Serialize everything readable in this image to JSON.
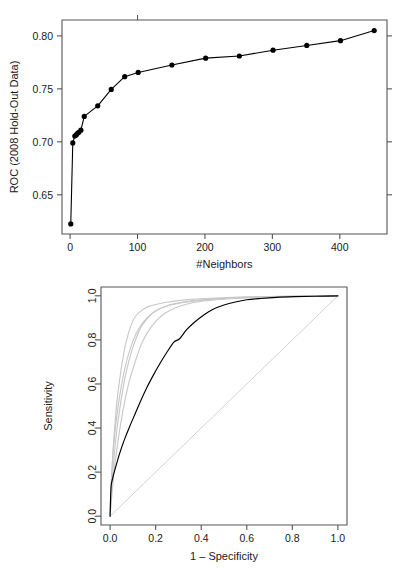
{
  "figure": {
    "title": "",
    "panel_count": 2
  },
  "chart_data": [
    {
      "id": "neighbors-roc",
      "type": "line",
      "title": "",
      "xlabel": "#Neighbors",
      "ylabel": "ROC (2008 Hold-Out Data)",
      "xlim": [
        -12,
        470
      ],
      "ylim": [
        0.613,
        0.815
      ],
      "xticks": [
        0,
        100,
        200,
        300,
        400
      ],
      "xtick_labels": [
        "0",
        "100",
        "200",
        "300",
        "400"
      ],
      "yticks": [
        0.65,
        0.7,
        0.75,
        0.8
      ],
      "ytick_labels": [
        "0.65",
        "0.70",
        "0.75",
        "0.80"
      ],
      "grid": false,
      "legend": "none",
      "marker": "filled-circle",
      "series": [
        {
          "name": "ROC vs neighbors",
          "color": "#000000",
          "x": [
            1,
            4,
            7,
            9,
            11,
            13,
            16,
            21,
            41,
            61,
            81,
            101,
            151,
            201,
            251,
            301,
            351,
            401,
            451
          ],
          "y": [
            0.6225,
            0.699,
            0.7055,
            0.7065,
            0.708,
            0.709,
            0.711,
            0.724,
            0.734,
            0.7495,
            0.7615,
            0.7655,
            0.7725,
            0.779,
            0.781,
            0.7865,
            0.791,
            0.7955,
            0.805
          ]
        }
      ]
    },
    {
      "id": "roc-curves",
      "type": "line",
      "title": "",
      "xlabel": "1 – Specificity",
      "ylabel": "Sensitivity",
      "xlim": [
        -0.04,
        1.04
      ],
      "ylim": [
        -0.04,
        1.04
      ],
      "xticks": [
        0.0,
        0.2,
        0.4,
        0.6,
        0.8,
        1.0
      ],
      "xtick_labels": [
        "0.0",
        "0.2",
        "0.4",
        "0.6",
        "0.8",
        "1.0"
      ],
      "yticks": [
        0.0,
        0.2,
        0.4,
        0.6,
        0.8,
        1.0
      ],
      "ytick_labels": [
        "0.0",
        "0.2",
        "0.4",
        "0.6",
        "0.8",
        "1.0"
      ],
      "grid": false,
      "legend": "none",
      "reference_line": {
        "name": "chance-diagonal",
        "color": "#d2d2d2",
        "from": [
          0.0,
          0.0
        ],
        "to": [
          1.0,
          1.0
        ]
      },
      "series": [
        {
          "name": "gray-curve-1",
          "color": "#c8c8c8",
          "x": [
            0.0,
            0.005,
            0.012,
            0.02,
            0.03,
            0.042,
            0.055,
            0.07,
            0.09,
            0.11,
            0.14,
            0.17,
            0.21,
            0.25,
            0.3,
            0.36,
            0.44,
            0.54,
            0.66,
            0.8,
            1.0
          ],
          "y": [
            0.0,
            0.14,
            0.28,
            0.4,
            0.52,
            0.62,
            0.71,
            0.79,
            0.86,
            0.905,
            0.935,
            0.952,
            0.963,
            0.971,
            0.978,
            0.984,
            0.989,
            0.993,
            0.996,
            0.998,
            1.0
          ]
        },
        {
          "name": "gray-curve-2",
          "color": "#c8c8c8",
          "x": [
            0.0,
            0.006,
            0.015,
            0.026,
            0.04,
            0.055,
            0.072,
            0.092,
            0.115,
            0.14,
            0.17,
            0.205,
            0.245,
            0.29,
            0.345,
            0.41,
            0.49,
            0.58,
            0.7,
            0.84,
            1.0
          ],
          "y": [
            0.0,
            0.12,
            0.24,
            0.36,
            0.47,
            0.57,
            0.66,
            0.74,
            0.81,
            0.865,
            0.905,
            0.934,
            0.953,
            0.966,
            0.975,
            0.983,
            0.989,
            0.993,
            0.996,
            0.998,
            1.0
          ]
        },
        {
          "name": "gray-curve-3",
          "color": "#c8c8c8",
          "x": [
            0.0,
            0.008,
            0.018,
            0.032,
            0.048,
            0.066,
            0.086,
            0.11,
            0.135,
            0.165,
            0.2,
            0.24,
            0.285,
            0.335,
            0.395,
            0.465,
            0.545,
            0.64,
            0.75,
            0.87,
            1.0
          ],
          "y": [
            0.0,
            0.1,
            0.21,
            0.32,
            0.43,
            0.53,
            0.62,
            0.7,
            0.775,
            0.835,
            0.884,
            0.92,
            0.945,
            0.962,
            0.974,
            0.982,
            0.988,
            0.993,
            0.996,
            0.998,
            1.0
          ]
        },
        {
          "name": "gray-curve-4",
          "color": "#c8c8c8",
          "x": [
            0.0,
            0.004,
            0.011,
            0.021,
            0.034,
            0.05,
            0.068,
            0.09,
            0.115,
            0.145,
            0.18,
            0.22,
            0.265,
            0.315,
            0.375,
            0.45,
            0.53,
            0.63,
            0.74,
            0.86,
            1.0
          ],
          "y": [
            0.0,
            0.13,
            0.26,
            0.38,
            0.49,
            0.595,
            0.685,
            0.765,
            0.83,
            0.88,
            0.917,
            0.942,
            0.958,
            0.969,
            0.977,
            0.984,
            0.99,
            0.994,
            0.997,
            0.999,
            1.0
          ]
        },
        {
          "name": "black-curve",
          "color": "#000000",
          "x": [
            0.0,
            0.004,
            0.012,
            0.025,
            0.042,
            0.062,
            0.085,
            0.11,
            0.135,
            0.162,
            0.19,
            0.22,
            0.25,
            0.28,
            0.305,
            0.335,
            0.37,
            0.41,
            0.45,
            0.5,
            0.55,
            0.6,
            0.66,
            0.73,
            0.81,
            0.9,
            1.0
          ],
          "y": [
            0.0,
            0.13,
            0.175,
            0.225,
            0.285,
            0.345,
            0.405,
            0.465,
            0.525,
            0.585,
            0.64,
            0.695,
            0.745,
            0.79,
            0.805,
            0.845,
            0.88,
            0.912,
            0.938,
            0.958,
            0.972,
            0.982,
            0.988,
            0.993,
            0.996,
            0.998,
            1.0
          ]
        }
      ]
    }
  ]
}
